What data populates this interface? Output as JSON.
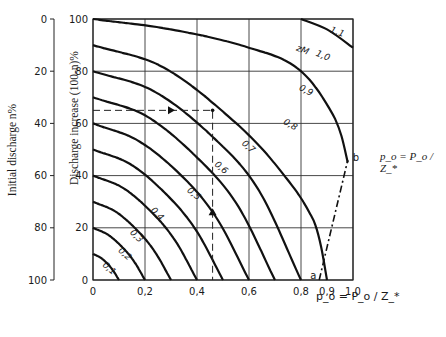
{
  "chart_data": {
    "type": "line",
    "title": "",
    "xlabel": "p_o = P_o / Z_*",
    "ylabel": "Discharge increase (100-n)%",
    "ylabel_secondary": "Initial discharge n%",
    "side_formula": "p_o = P_o / Z_*",
    "xlim": [
      0,
      1.0
    ],
    "ylim": [
      0,
      100
    ],
    "grid": true,
    "x_ticks": [
      "0",
      "0,2",
      "0,4",
      "0,6",
      "0,8",
      "0,9",
      "1,0"
    ],
    "x_tick_values": [
      0,
      0.2,
      0.4,
      0.6,
      0.8,
      0.9,
      1.0
    ],
    "y_ticks": [
      "0",
      "20",
      "40",
      "60",
      "80",
      "100"
    ],
    "y_tick_values": [
      0,
      20,
      40,
      60,
      80,
      100
    ],
    "y2_ticks": [
      "100",
      "80",
      "60",
      "40",
      "20",
      "0"
    ],
    "curve_family_label": "z_M",
    "series": [
      {
        "name": "0,1",
        "z": 0.1,
        "x": [
          0,
          0.03,
          0.06,
          0.08,
          0.1
        ],
        "y": [
          10,
          8.5,
          5.8,
          3.2,
          0
        ]
      },
      {
        "name": "0,2",
        "z": 0.2,
        "x": [
          0,
          0.06,
          0.12,
          0.16,
          0.2
        ],
        "y": [
          20,
          17.2,
          11.8,
          6.8,
          0
        ]
      },
      {
        "name": "0,3",
        "z": 0.3,
        "x": [
          0,
          0.09,
          0.18,
          0.24,
          0.3
        ],
        "y": [
          30,
          26,
          18,
          10.5,
          0
        ]
      },
      {
        "name": "0,4",
        "z": 0.4,
        "x": [
          0,
          0.12,
          0.24,
          0.32,
          0.4
        ],
        "y": [
          40,
          35,
          24.5,
          14.5,
          0
        ]
      },
      {
        "name": "0,5",
        "z": 0.5,
        "x": [
          0,
          0.15,
          0.3,
          0.4,
          0.5
        ],
        "y": [
          50,
          44,
          31,
          18.5,
          0
        ]
      },
      {
        "name": "0,6",
        "z": 0.6,
        "x": [
          0,
          0.18,
          0.36,
          0.48,
          0.6
        ],
        "y": [
          60,
          53,
          38,
          23,
          0
        ]
      },
      {
        "name": "0,7",
        "z": 0.7,
        "x": [
          0,
          0.21,
          0.42,
          0.56,
          0.7
        ],
        "y": [
          70,
          62.5,
          45,
          28,
          0
        ]
      },
      {
        "name": "0,8",
        "z": 0.8,
        "x": [
          0,
          0.24,
          0.48,
          0.64,
          0.8
        ],
        "y": [
          80,
          72,
          53,
          34,
          0
        ]
      },
      {
        "name": "0,9",
        "z": 0.9,
        "x": [
          0,
          0.27,
          0.54,
          0.72,
          0.86,
          0.9
        ],
        "y": [
          90,
          81.5,
          61,
          42,
          20,
          0
        ]
      },
      {
        "name": "1,0",
        "z": 1.0,
        "x": [
          0,
          0.3,
          0.6,
          0.8,
          0.94,
          0.98
        ],
        "y": [
          100,
          96,
          89,
          80,
          60,
          45
        ]
      },
      {
        "name": "1,1",
        "z": 1.1,
        "x": [
          0.8,
          0.9,
          1.0
        ],
        "y": [
          100,
          96,
          89
        ]
      }
    ],
    "boundary_line": {
      "style": "dash-dot",
      "from_label": "a",
      "from": [
        0.87,
        0
      ],
      "to_label": "b",
      "to": [
        0.98,
        46
      ]
    },
    "example_path": {
      "style": "dashed",
      "start": [
        0,
        65
      ],
      "corner": [
        0.46,
        65
      ],
      "end": [
        0.46,
        0
      ],
      "arrows": [
        {
          "at": [
            0.3,
            65
          ],
          "dir": "right"
        },
        {
          "at": [
            0.46,
            26
          ],
          "dir": "up"
        }
      ]
    },
    "annotations": [
      "a",
      "b",
      "z_M"
    ]
  }
}
